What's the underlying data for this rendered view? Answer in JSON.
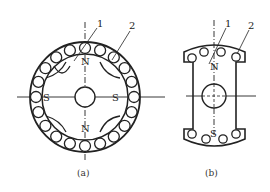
{
  "figure": {
    "panel_a": {
      "caption": "(a)",
      "pole_labels": {
        "top": "N",
        "bottom": "N",
        "left": "S",
        "right": "S"
      },
      "callouts": {
        "one": "1",
        "two": "2"
      }
    },
    "panel_b": {
      "caption": "(b)",
      "pole_labels": {
        "top": "N",
        "bottom": "S"
      },
      "callouts": {
        "one": "1",
        "two": "2"
      }
    }
  }
}
